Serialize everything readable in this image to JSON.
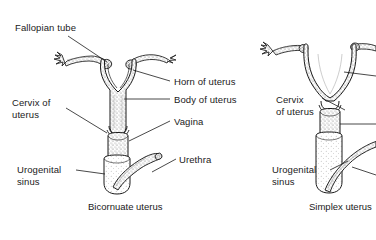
{
  "figure": {
    "type": "anatomical-line-diagram",
    "background_color": "#ffffff",
    "ink_color": "#1a1a1a",
    "shade_color": "#cfcfcf",
    "panels": [
      {
        "id": "bicornuate",
        "caption": "Bicornuate uterus",
        "labels": [
          {
            "id": "fallopian-tube",
            "text": "Fallopian tube",
            "lines": [
              "Fallopian tube"
            ]
          },
          {
            "id": "horn-of-uterus",
            "text": "Horn of uterus",
            "lines": [
              "Horn of uterus"
            ]
          },
          {
            "id": "body-of-uterus",
            "text": "Body of uterus",
            "lines": [
              "Body of uterus"
            ]
          },
          {
            "id": "cervix-of-uterus",
            "text": "Cervix of uterus",
            "lines": [
              "Cervix of",
              "uterus"
            ]
          },
          {
            "id": "vagina",
            "text": "Vagina",
            "lines": [
              "Vagina"
            ]
          },
          {
            "id": "urethra",
            "text": "Urethra",
            "lines": [
              "Urethra"
            ]
          },
          {
            "id": "urogenital-sinus",
            "text": "Urogenital sinus",
            "lines": [
              "Urogenital",
              "sinus"
            ]
          }
        ]
      },
      {
        "id": "simplex",
        "caption": "Simplex uterus",
        "labels": [
          {
            "id": "cervix-of-uterus",
            "text": "Cervix of uterus",
            "lines": [
              "Cervix",
              "of uterus"
            ]
          },
          {
            "id": "urogenital-sinus",
            "text": "Urogenital sinus",
            "lines": [
              "Urogenital",
              "sinus"
            ]
          }
        ]
      }
    ]
  },
  "labels": {
    "fallopian_tube": "Fallopian tube",
    "horn_of_uterus": "Horn of uterus",
    "body_of_uterus": "Body of uterus",
    "cervix_of_l1": "Cervix of",
    "cervix_of_l2": "uterus",
    "vagina": "Vagina",
    "urethra": "Urethra",
    "urogenital_l1": "Urogenital",
    "urogenital_l2": "sinus",
    "r_cervix_l1": "Cervix",
    "r_cervix_l2": "of uterus",
    "r_urogenital_l1": "Urogenital",
    "r_urogenital_l2": "sinus"
  },
  "captions": {
    "left": "Bicornuate uterus",
    "right": "Simplex uterus"
  }
}
